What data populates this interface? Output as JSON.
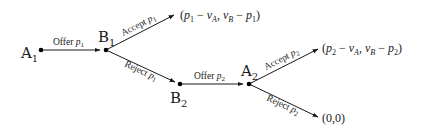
{
  "diagram": {
    "type": "game-tree",
    "nodes": {
      "A1": {
        "label": "A",
        "sub": "1"
      },
      "B1": {
        "label": "B",
        "sub": "1"
      },
      "B2": {
        "label": "B",
        "sub": "2"
      },
      "A2": {
        "label": "A",
        "sub": "2"
      }
    },
    "edges": {
      "offer_p1": {
        "text": "Offer ",
        "var": "p",
        "sub": "1"
      },
      "accept_p1": {
        "text": "Accept ",
        "var": "p",
        "sub": "1"
      },
      "reject_p1": {
        "text": "Reject ",
        "var": "p",
        "sub": "1"
      },
      "offer_p2": {
        "text": "Offer ",
        "var": "p",
        "sub": "2"
      },
      "accept_p2": {
        "text": "Accept ",
        "var": "p",
        "sub": "2"
      },
      "reject_p2": {
        "text": "Reject ",
        "var": "p",
        "sub": "2"
      }
    },
    "payoffs": {
      "accept_p1": {
        "open": "(",
        "p": "p",
        "psub": "1",
        "minus1": " − ",
        "v": "v",
        "vsubA": "A",
        "comma": ", ",
        "v2": "v",
        "vsubB": "B",
        "minus2": " − ",
        "p2": "p",
        "p2sub": "1",
        "close": ")"
      },
      "accept_p2": {
        "open": "(",
        "p": "p",
        "psub": "2",
        "minus1": " − ",
        "v": "v",
        "vsubA": "A",
        "comma": ", ",
        "v2": "v",
        "vsubB": "B",
        "minus2": " − ",
        "p2": "p",
        "p2sub": "2",
        "close": ")"
      },
      "reject_p2": {
        "text": "(0,0)"
      }
    },
    "colors": {
      "line": "#1a1a1a",
      "background": "#ffffff"
    }
  }
}
